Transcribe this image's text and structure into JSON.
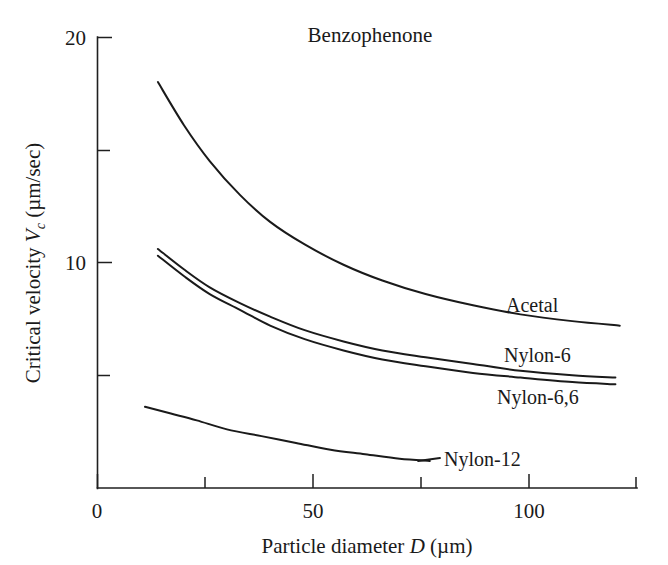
{
  "chart_data": {
    "type": "line",
    "title": "Benzophenone",
    "xlabel_parts": {
      "lead": "Particle diameter ",
      "symbol": "D",
      "unit": " (µm)"
    },
    "ylabel_parts": {
      "lead": "Critical velocity ",
      "symbol": "V",
      "subscript": "c",
      "unit": " (µm/sec)"
    },
    "xlabel": "Particle diameter D (µm)",
    "ylabel": "Critical velocity Vc (µm/sec)",
    "xlim": [
      0,
      125
    ],
    "ylim": [
      0,
      20
    ],
    "x_major_ticks": [
      0,
      50,
      100
    ],
    "x_minor_ticks": [
      25,
      75
    ],
    "x_tick_labels": [
      "0",
      "50",
      "100"
    ],
    "y_major_ticks": [
      10,
      20
    ],
    "y_minor_ticks": [
      5,
      15
    ],
    "y_tick_labels": [
      "10",
      "20"
    ],
    "grid": false,
    "legend_position": "inline-annotations",
    "series": [
      {
        "name": "Acetal",
        "label": "Acetal",
        "label_x": 103,
        "label_y": 8.6,
        "x": [
          14,
          20,
          26,
          33,
          40,
          48,
          57,
          66,
          76,
          87,
          98,
          110,
          121
        ],
        "y": [
          18.0,
          16.1,
          14.5,
          13.0,
          11.8,
          10.8,
          9.9,
          9.2,
          8.6,
          8.1,
          7.7,
          7.4,
          7.2
        ]
      },
      {
        "name": "Nylon-6",
        "label": "Nylon-6",
        "label_x": 104,
        "label_y": 6.4,
        "x": [
          14,
          20,
          26,
          33,
          40,
          48,
          57,
          66,
          76,
          87,
          98,
          110,
          120
        ],
        "y": [
          10.6,
          9.7,
          8.9,
          8.2,
          7.6,
          7.0,
          6.5,
          6.1,
          5.8,
          5.5,
          5.2,
          5.0,
          4.9
        ]
      },
      {
        "name": "Nylon-6,6",
        "label": "Nylon-6,6",
        "label_x": 105,
        "label_y": 4.6,
        "x": [
          14,
          20,
          26,
          33,
          40,
          48,
          57,
          66,
          76,
          87,
          98,
          110,
          120
        ],
        "y": [
          10.3,
          9.4,
          8.6,
          7.9,
          7.2,
          6.6,
          6.1,
          5.7,
          5.4,
          5.1,
          4.9,
          4.7,
          4.6
        ]
      },
      {
        "name": "Nylon-12",
        "label": "Nylon-12",
        "label_x": 84,
        "label_y": 1.8,
        "x": [
          11,
          17,
          23,
          30,
          38,
          46,
          54,
          62,
          70,
          77
        ],
        "y": [
          3.6,
          3.3,
          3.0,
          2.6,
          2.3,
          2.0,
          1.7,
          1.5,
          1.3,
          1.2
        ]
      }
    ]
  },
  "colors": {
    "ink": "#1a1a1a",
    "background": "#ffffff"
  }
}
